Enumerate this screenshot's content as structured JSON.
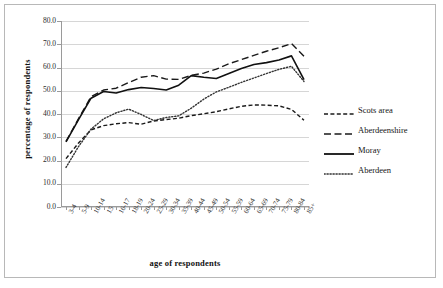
{
  "chart_data": {
    "type": "line",
    "title": "",
    "xlabel": "age of respondents",
    "ylabel": "percentage of respondents",
    "ylim": [
      0.0,
      80.0
    ],
    "ytick_step": 10.0,
    "ytick_labels": [
      "80.0",
      "70.0",
      "60.0",
      "50.0",
      "40.0",
      "30.0",
      "20.0",
      "10.0",
      "0.0"
    ],
    "grid": true,
    "legend_position": "right",
    "categories": [
      "3-4",
      "5-9",
      "10-14",
      "15",
      "16-17",
      "18-19",
      "20-24",
      "25-29",
      "30-34",
      "35-39",
      "40-44",
      "45-49",
      "50-54",
      "55-59",
      "60-64",
      "65-69",
      "70-74",
      "75-79",
      "80-84",
      "85+"
    ],
    "series": [
      {
        "name": "Scots area",
        "style": "short-dashed",
        "color": "#1a1a1a",
        "values": [
          20.8,
          27.5,
          33.2,
          35.0,
          35.8,
          36.3,
          35.6,
          37.0,
          37.6,
          38.2,
          39.3,
          40.1,
          41.0,
          42.2,
          43.3,
          43.9,
          43.8,
          43.5,
          42.0,
          37.3
        ]
      },
      {
        "name": "Aberdeenshire",
        "style": "long-dashed",
        "color": "#1a1a1a",
        "values": [
          28.2,
          38.0,
          47.5,
          50.3,
          51.1,
          53.5,
          55.8,
          56.5,
          55.0,
          54.9,
          56.6,
          57.6,
          59.3,
          61.6,
          63.4,
          65.2,
          67.0,
          68.5,
          70.3,
          64.8
        ]
      },
      {
        "name": "Moray",
        "style": "solid",
        "color": "#111111",
        "values": [
          28.0,
          37.6,
          46.8,
          49.7,
          49.0,
          50.5,
          51.4,
          51.0,
          50.3,
          52.4,
          56.5,
          55.8,
          55.3,
          57.4,
          59.6,
          61.3,
          62.1,
          63.2,
          65.0,
          54.8
        ]
      },
      {
        "name": "Aberdeen",
        "style": "dotted",
        "color": "#333333",
        "values": [
          17.0,
          26.0,
          33.5,
          37.9,
          40.5,
          42.1,
          39.8,
          37.2,
          38.5,
          39.2,
          42.5,
          46.4,
          49.5,
          51.5,
          53.6,
          55.5,
          57.4,
          59.2,
          60.5,
          54.0
        ]
      }
    ]
  },
  "legend": {
    "items": [
      {
        "label": "Scots area"
      },
      {
        "label": "Aberdeenshire"
      },
      {
        "label": "Moray"
      },
      {
        "label": "Aberdeen"
      }
    ]
  }
}
